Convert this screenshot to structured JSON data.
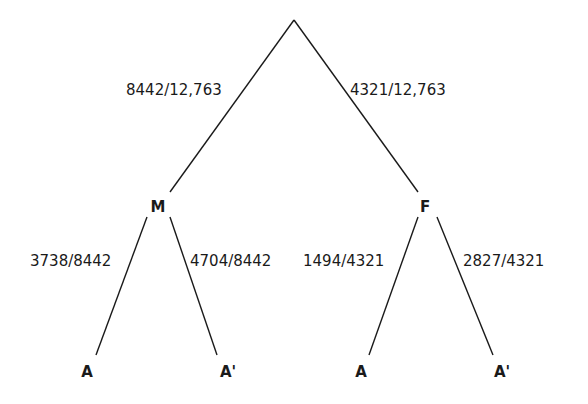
{
  "diagram": {
    "type": "probability-tree",
    "root": {
      "label": "",
      "children": [
        {
          "node_label": "M",
          "edge_label": "8442/12,763",
          "children": [
            {
              "node_label": "A",
              "edge_label": "3738/8442"
            },
            {
              "node_label": "A'",
              "edge_label": "4704/8442"
            }
          ]
        },
        {
          "node_label": "F",
          "edge_label": "4321/12,763",
          "children": [
            {
              "node_label": "A",
              "edge_label": "1494/4321"
            },
            {
              "node_label": "A'",
              "edge_label": "2827/4321"
            }
          ]
        }
      ]
    }
  }
}
